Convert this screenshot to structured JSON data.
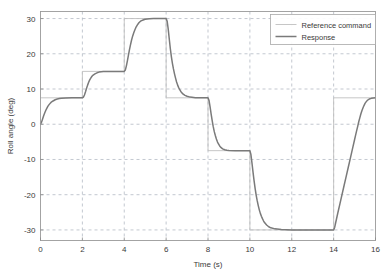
{
  "chart_data": {
    "type": "line",
    "title": "",
    "xlabel": "Time (s)",
    "ylabel": "Roll angle (deg)",
    "xlim": [
      0,
      16
    ],
    "ylim": [
      -33,
      32
    ],
    "xticks": [
      0,
      2,
      4,
      6,
      8,
      10,
      12,
      14,
      16
    ],
    "xtick_labels": [
      "0",
      "2",
      "4",
      "6",
      "8",
      "10",
      "12",
      "14",
      "16"
    ],
    "yticks": [
      30,
      20,
      10,
      0,
      -10,
      -20,
      -30
    ],
    "ytick_labels": [
      "30",
      "20",
      "10",
      "0",
      "-10",
      "-20",
      "-30"
    ],
    "grid": true,
    "grid_style": "dashed",
    "legend_position": "upper-right",
    "legend_entries": [
      "Reference command",
      "Response"
    ],
    "series": [
      {
        "name": "Reference command",
        "color": "#bfbfbf",
        "width": 0.9,
        "style": "step",
        "steps": [
          {
            "t_start": 0,
            "t_end": 2,
            "value": 7.5
          },
          {
            "t_start": 2,
            "t_end": 4,
            "value": 15
          },
          {
            "t_start": 4,
            "t_end": 6,
            "value": 30
          },
          {
            "t_start": 6,
            "t_end": 8,
            "value": 7.5
          },
          {
            "t_start": 8,
            "t_end": 10,
            "value": -7.5
          },
          {
            "t_start": 10,
            "t_end": 14,
            "value": -30
          },
          {
            "t_start": 14,
            "t_end": 16,
            "value": 7.5
          }
        ],
        "points": [
          [
            0,
            7.5
          ],
          [
            2,
            7.5
          ],
          [
            2,
            15
          ],
          [
            4,
            15
          ],
          [
            4,
            30
          ],
          [
            6,
            30
          ],
          [
            6,
            7.5
          ],
          [
            8,
            7.5
          ],
          [
            8,
            -7.5
          ],
          [
            10,
            -7.5
          ],
          [
            10,
            -30
          ],
          [
            14,
            -30
          ],
          [
            14,
            7.5
          ],
          [
            16,
            7.5
          ]
        ]
      },
      {
        "name": "Response",
        "color": "#7a7a7a",
        "width": 1.5,
        "style": "solid",
        "points": [
          [
            0.0,
            0.0
          ],
          [
            0.05,
            0.6
          ],
          [
            0.1,
            1.5
          ],
          [
            0.15,
            2.4
          ],
          [
            0.2,
            3.2
          ],
          [
            0.25,
            3.9
          ],
          [
            0.3,
            4.5
          ],
          [
            0.35,
            5.05
          ],
          [
            0.4,
            5.5
          ],
          [
            0.45,
            5.85
          ],
          [
            0.5,
            6.2
          ],
          [
            0.6,
            6.6
          ],
          [
            0.7,
            6.95
          ],
          [
            0.8,
            7.15
          ],
          [
            0.9,
            7.3
          ],
          [
            1.0,
            7.38
          ],
          [
            1.2,
            7.46
          ],
          [
            1.5,
            7.5
          ],
          [
            2.0,
            7.5
          ],
          [
            2.05,
            7.7
          ],
          [
            2.1,
            8.3
          ],
          [
            2.15,
            9.2
          ],
          [
            2.2,
            10.2
          ],
          [
            2.25,
            11.1
          ],
          [
            2.3,
            11.9
          ],
          [
            2.35,
            12.6
          ],
          [
            2.4,
            13.1
          ],
          [
            2.45,
            13.55
          ],
          [
            2.5,
            13.9
          ],
          [
            2.6,
            14.3
          ],
          [
            2.7,
            14.6
          ],
          [
            2.8,
            14.8
          ],
          [
            2.9,
            14.9
          ],
          [
            3.0,
            14.95
          ],
          [
            3.2,
            15.0
          ],
          [
            3.6,
            15.0
          ],
          [
            4.0,
            15.0
          ],
          [
            4.05,
            15.4
          ],
          [
            4.1,
            16.5
          ],
          [
            4.15,
            18.0
          ],
          [
            4.2,
            19.6
          ],
          [
            4.25,
            21.2
          ],
          [
            4.3,
            22.6
          ],
          [
            4.35,
            23.9
          ],
          [
            4.4,
            25.0
          ],
          [
            4.45,
            25.9
          ],
          [
            4.5,
            26.7
          ],
          [
            4.55,
            27.4
          ],
          [
            4.6,
            27.9
          ],
          [
            4.65,
            28.4
          ],
          [
            4.7,
            28.8
          ],
          [
            4.75,
            29.1
          ],
          [
            4.8,
            29.35
          ],
          [
            4.9,
            29.6
          ],
          [
            5.0,
            29.8
          ],
          [
            5.1,
            29.9
          ],
          [
            5.2,
            29.95
          ],
          [
            5.4,
            30.0
          ],
          [
            5.7,
            30.0
          ],
          [
            6.0,
            30.0
          ],
          [
            6.05,
            29.2
          ],
          [
            6.1,
            27.0
          ],
          [
            6.15,
            24.2
          ],
          [
            6.2,
            21.5
          ],
          [
            6.25,
            19.2
          ],
          [
            6.3,
            17.3
          ],
          [
            6.35,
            15.7
          ],
          [
            6.4,
            14.3
          ],
          [
            6.45,
            13.1
          ],
          [
            6.5,
            12.0
          ],
          [
            6.55,
            11.1
          ],
          [
            6.6,
            10.4
          ],
          [
            6.65,
            9.8
          ],
          [
            6.7,
            9.3
          ],
          [
            6.8,
            8.6
          ],
          [
            6.9,
            8.2
          ],
          [
            7.0,
            7.95
          ],
          [
            7.15,
            7.7
          ],
          [
            7.4,
            7.55
          ],
          [
            7.7,
            7.5
          ],
          [
            8.0,
            7.5
          ],
          [
            8.05,
            6.7
          ],
          [
            8.1,
            4.9
          ],
          [
            8.15,
            2.9
          ],
          [
            8.2,
            1.0
          ],
          [
            8.25,
            -0.7
          ],
          [
            8.3,
            -2.1
          ],
          [
            8.35,
            -3.2
          ],
          [
            8.4,
            -4.2
          ],
          [
            8.45,
            -5.0
          ],
          [
            8.5,
            -5.6
          ],
          [
            8.55,
            -6.1
          ],
          [
            8.6,
            -6.5
          ],
          [
            8.7,
            -7.0
          ],
          [
            8.8,
            -7.25
          ],
          [
            8.9,
            -7.4
          ],
          [
            9.0,
            -7.45
          ],
          [
            9.3,
            -7.5
          ],
          [
            9.7,
            -7.5
          ],
          [
            10.0,
            -7.5
          ],
          [
            10.05,
            -8.6
          ],
          [
            10.1,
            -11.0
          ],
          [
            10.15,
            -13.6
          ],
          [
            10.2,
            -16.0
          ],
          [
            10.25,
            -18.2
          ],
          [
            10.3,
            -20.1
          ],
          [
            10.35,
            -21.7
          ],
          [
            10.4,
            -23.1
          ],
          [
            10.45,
            -24.3
          ],
          [
            10.5,
            -25.3
          ],
          [
            10.55,
            -26.1
          ],
          [
            10.6,
            -26.8
          ],
          [
            10.65,
            -27.4
          ],
          [
            10.7,
            -27.9
          ],
          [
            10.8,
            -28.6
          ],
          [
            10.9,
            -29.1
          ],
          [
            11.0,
            -29.4
          ],
          [
            11.2,
            -29.7
          ],
          [
            11.5,
            -29.9
          ],
          [
            12.0,
            -30.0
          ],
          [
            13.0,
            -30.0
          ],
          [
            14.0,
            -30.0
          ],
          [
            14.05,
            -29.3
          ],
          [
            14.1,
            -27.9
          ],
          [
            14.2,
            -25.2
          ],
          [
            14.3,
            -22.6
          ],
          [
            14.4,
            -20.0
          ],
          [
            14.5,
            -17.4
          ],
          [
            14.6,
            -14.8
          ],
          [
            14.7,
            -12.2
          ],
          [
            14.8,
            -9.6
          ],
          [
            14.9,
            -7.0
          ],
          [
            15.0,
            -4.4
          ],
          [
            15.05,
            -3.1
          ],
          [
            15.1,
            -1.8
          ],
          [
            15.15,
            -0.6
          ],
          [
            15.2,
            0.7
          ],
          [
            15.25,
            1.8
          ],
          [
            15.3,
            2.9
          ],
          [
            15.35,
            3.8
          ],
          [
            15.4,
            4.6
          ],
          [
            15.45,
            5.3
          ],
          [
            15.5,
            5.9
          ],
          [
            15.55,
            6.35
          ],
          [
            15.6,
            6.7
          ],
          [
            15.65,
            6.95
          ],
          [
            15.7,
            7.15
          ],
          [
            15.8,
            7.35
          ],
          [
            15.9,
            7.45
          ],
          [
            16.0,
            7.5
          ]
        ]
      }
    ]
  },
  "colors": {
    "background": "#ffffff",
    "grid": "#9aa3b0",
    "frame": "#9a9a9a",
    "reference_command": "#bfbfbf",
    "response": "#7a7a7a",
    "text": "#3a3a3a"
  }
}
